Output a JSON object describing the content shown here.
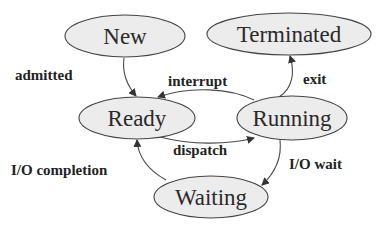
{
  "diagram": {
    "colors": {
      "background": "#ffffff",
      "node_fill": "#ececec",
      "node_stroke": "#444444",
      "text": "#222222"
    },
    "nodes": {
      "new": {
        "label": "New"
      },
      "terminated": {
        "label": "Terminated"
      },
      "ready": {
        "label": "Ready"
      },
      "running": {
        "label": "Running"
      },
      "waiting": {
        "label": "Waiting"
      }
    },
    "edges": {
      "admitted": {
        "from": "New",
        "to": "Ready",
        "label": "admitted"
      },
      "interrupt": {
        "from": "Running",
        "to": "Ready",
        "label": "interrupt"
      },
      "exit": {
        "from": "Running",
        "to": "Terminated",
        "label": "exit"
      },
      "dispatch": {
        "from": "Ready",
        "to": "Running",
        "label": "dispatch"
      },
      "io_completion": {
        "from": "Waiting",
        "to": "Ready",
        "label": "I/O completion"
      },
      "io_wait": {
        "from": "Running",
        "to": "Waiting",
        "label": "I/O wait"
      }
    }
  }
}
